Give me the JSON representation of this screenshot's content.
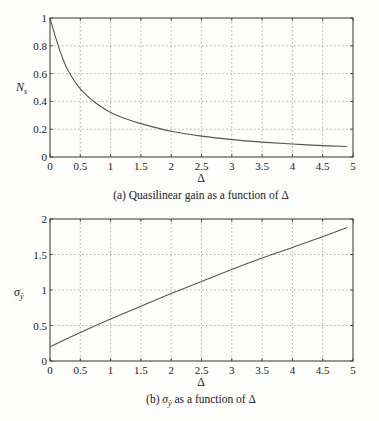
{
  "chart_data": [
    {
      "type": "line",
      "title": "",
      "caption": "(a) Quasilinear gain as a function of Δ",
      "xlabel": "Δ",
      "ylabel": "N_s",
      "xlim": [
        0,
        5
      ],
      "ylim": [
        0,
        1
      ],
      "xticks": [
        "0",
        "0.5",
        "1",
        "1.5",
        "2",
        "2.5",
        "3",
        "3.5",
        "4",
        "4.5",
        "5"
      ],
      "yticks": [
        "0",
        "0.2",
        "0.4",
        "0.6",
        "0.8",
        "1"
      ],
      "grid": true,
      "series": [
        {
          "name": "N_s",
          "x": [
            0,
            0.1,
            0.2,
            0.3,
            0.5,
            0.75,
            1,
            1.25,
            1.5,
            2,
            2.5,
            3,
            3.5,
            4,
            4.5,
            4.9
          ],
          "y": [
            1.0,
            0.85,
            0.72,
            0.62,
            0.49,
            0.39,
            0.32,
            0.275,
            0.24,
            0.185,
            0.15,
            0.125,
            0.107,
            0.093,
            0.082,
            0.075
          ]
        }
      ]
    },
    {
      "type": "line",
      "title": "",
      "caption": "(b) σ_ŷ as a function of Δ",
      "xlabel": "Δ",
      "ylabel": "σ_ŷ",
      "xlim": [
        0,
        5
      ],
      "ylim": [
        0,
        2
      ],
      "xticks": [
        "0",
        "0.5",
        "1",
        "1.5",
        "2",
        "2.5",
        "3",
        "3.5",
        "4",
        "4.5",
        "5"
      ],
      "yticks": [
        "0",
        "0.5",
        "1",
        "1.5",
        "2"
      ],
      "grid": true,
      "series": [
        {
          "name": "σ_ŷ",
          "x": [
            0,
            0.5,
            1,
            1.5,
            2,
            2.5,
            3,
            3.5,
            4,
            4.5,
            4.9
          ],
          "y": [
            0.2,
            0.4,
            0.59,
            0.77,
            0.95,
            1.12,
            1.29,
            1.45,
            1.6,
            1.75,
            1.88
          ]
        }
      ]
    }
  ],
  "labels": {
    "a_ylabel_main": "N",
    "a_ylabel_sub": "s",
    "a_xlabel": "Δ",
    "a_caption": "(a) Quasilinear gain as a function of Δ",
    "b_ylabel_main": "σ",
    "b_ylabel_sub": "ŷ",
    "b_xlabel": "Δ",
    "b_caption_pre": "(b) ",
    "b_caption_sym": "σ",
    "b_caption_sub": "ŷ",
    "b_caption_post": " as a function of Δ"
  }
}
